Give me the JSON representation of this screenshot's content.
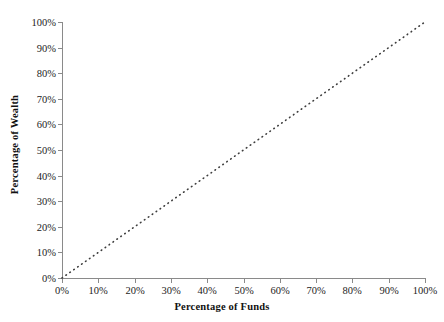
{
  "chart_data": {
    "type": "line",
    "title": "",
    "subtitle": "",
    "xlabel": "Percentage of Funds",
    "ylabel": "Percentage of Wealth",
    "xlim": [
      0,
      100
    ],
    "ylim": [
      0,
      100
    ],
    "grid": false,
    "legend": false,
    "legend_position": "none",
    "x_tick_labels": [
      "0%",
      "10%",
      "20%",
      "30%",
      "40%",
      "50%",
      "60%",
      "70%",
      "80%",
      "90%",
      "100%"
    ],
    "y_tick_labels": [
      "0%",
      "10%",
      "20%",
      "30%",
      "40%",
      "50%",
      "60%",
      "70%",
      "80%",
      "90%",
      "100%"
    ],
    "x_ticks": [
      0,
      10,
      20,
      30,
      40,
      50,
      60,
      70,
      80,
      90,
      100
    ],
    "y_ticks": [
      0,
      10,
      20,
      30,
      40,
      50,
      60,
      70,
      80,
      90,
      100
    ],
    "series": [
      {
        "name": "Line of equality",
        "style": "dotted",
        "color": "#3d3d3d",
        "x": [
          0,
          10,
          20,
          30,
          40,
          50,
          60,
          70,
          80,
          90,
          100
        ],
        "values": [
          0,
          10,
          20,
          30,
          40,
          50,
          60,
          70,
          80,
          90,
          100
        ]
      }
    ],
    "annotations": []
  },
  "colors": {
    "background": "#ffffff",
    "axis": "#8a8a8a",
    "tick_label": "#232323",
    "axis_title": "#111111",
    "series_line": "#3d3d3d"
  }
}
